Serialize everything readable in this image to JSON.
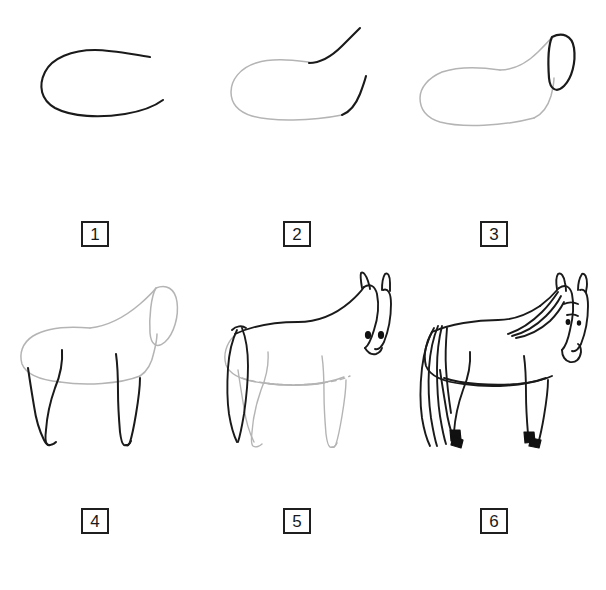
{
  "document": {
    "title": "How to Draw a Horse — Step by Step",
    "background_color": "#ffffff",
    "width": 606,
    "height": 590
  },
  "style": {
    "new_stroke_color": "#1a1a1a",
    "previous_stroke_color": "#b4b4b4",
    "hoof_fill_color": "#111111",
    "eye_fill_color": "#111111",
    "label_border_color": "#1f1f1f",
    "label_text_color": "#1a1a1a"
  },
  "steps": [
    {
      "number": "1",
      "label": "1",
      "description": "Draw a large open C-shaped curve for the horse's barrel/body.",
      "new_elements": [
        "body-curve"
      ],
      "carried_over_elements": []
    },
    {
      "number": "2",
      "label": "2",
      "description": "Close the body outline and add two rising strokes for the neck.",
      "new_elements": [
        "neck-top-stroke",
        "neck-bottom-stroke"
      ],
      "carried_over_elements": [
        "body-outline"
      ]
    },
    {
      "number": "3",
      "label": "3",
      "description": "Add an elongated oval at the end of the neck for the head.",
      "new_elements": [
        "head-oval"
      ],
      "carried_over_elements": [
        "body-outline",
        "neck-outline"
      ]
    },
    {
      "number": "4",
      "label": "4",
      "description": "Add four legs descending from the body.",
      "new_elements": [
        "front-legs",
        "hind-legs"
      ],
      "carried_over_elements": [
        "body-outline",
        "neck-outline",
        "head-oval"
      ]
    },
    {
      "number": "5",
      "label": "5",
      "description": "Add the tail, the ears, the eyes and refine the head and chest lines.",
      "new_elements": [
        "tail",
        "ears",
        "eyes",
        "head-detail",
        "topline",
        "chest-line"
      ],
      "carried_over_elements": [
        "body-outline",
        "legs"
      ]
    },
    {
      "number": "6",
      "label": "6",
      "description": "Ink the final outline: flowing mane and tail, muzzle, and solid black hooves.",
      "new_elements": [
        "mane",
        "full-tail",
        "muzzle",
        "hooves",
        "final-outline"
      ],
      "carried_over_elements": []
    }
  ]
}
